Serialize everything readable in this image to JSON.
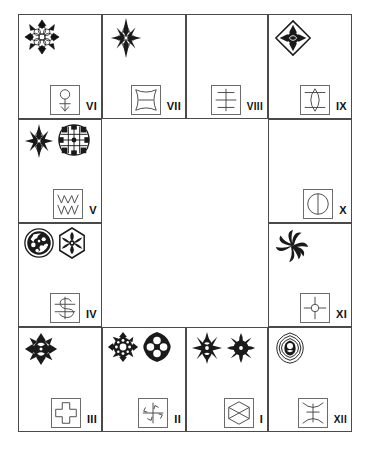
{
  "figure": {
    "type": "ring-diagram",
    "title": "",
    "cell_count": 12,
    "numeral_order_clockwise_from_top_left": [
      "VI",
      "VII",
      "VIII",
      "IX",
      "X",
      "XI",
      "XII",
      "I",
      "II",
      "III",
      "IV",
      "V"
    ],
    "center": "empty",
    "ink_color": "#1a1a1a",
    "frame_color": "#4a4a4a",
    "glyph_box_color": "#6b6b6b"
  },
  "cells": [
    {
      "id": "cell-vi",
      "numeral": "VI",
      "position": "top-row-1",
      "motif_names": [
        "eight-point-star-rosette-outline"
      ],
      "motif_count": 1,
      "glyph_name": "circle-on-stem-with-anchor-arrow"
    },
    {
      "id": "cell-vii",
      "numeral": "VII",
      "position": "top-row-2",
      "motif_names": [
        "four-point-spiky-star-dark"
      ],
      "motif_count": 1,
      "glyph_name": "concave-square-with-horizontal-bar"
    },
    {
      "id": "cell-viii",
      "numeral": "VIII",
      "position": "top-row-3",
      "motif_names": [],
      "motif_count": 0,
      "glyph_name": "cross-divided-square"
    },
    {
      "id": "cell-ix",
      "numeral": "IX",
      "position": "top-row-4",
      "motif_names": [
        "diamond-framed-rosette-dark"
      ],
      "motif_count": 1,
      "glyph_name": "square-with-vertical-lens"
    },
    {
      "id": "cell-x",
      "numeral": "X",
      "position": "right-col-1",
      "motif_names": [],
      "motif_count": 0,
      "glyph_name": "circle-with-vertical-diameter"
    },
    {
      "id": "cell-xi",
      "numeral": "XI",
      "position": "right-col-2",
      "motif_names": [
        "swirl-pinwheel-dark"
      ],
      "motif_count": 1,
      "glyph_name": "quartered-square-with-center-circle"
    },
    {
      "id": "cell-xii",
      "numeral": "XII",
      "position": "bottom-row-4",
      "motif_names": [
        "concentric-lobed-medallion"
      ],
      "motif_count": 1,
      "glyph_name": "square-with-hourglass-and-crossbar"
    },
    {
      "id": "cell-i",
      "numeral": "I",
      "position": "bottom-row-3",
      "motif_names": [
        "spiky-floral-burst-dark",
        "round-petal-rosette-dark"
      ],
      "motif_count": 2,
      "glyph_name": "square-with-crossed-diamond"
    },
    {
      "id": "cell-ii",
      "numeral": "II",
      "position": "bottom-row-2",
      "motif_names": [
        "cogwheel-rosette-dark",
        "quatrefoil-medallion-dark"
      ],
      "motif_count": 2,
      "glyph_name": "square-with-four-arrows-cross"
    },
    {
      "id": "cell-iii",
      "numeral": "III",
      "position": "bottom-row-1",
      "motif_names": [
        "star-burst-floral-dark"
      ],
      "motif_count": 1,
      "glyph_name": "greek-cross-outline"
    },
    {
      "id": "cell-iv",
      "numeral": "IV",
      "position": "left-col-2",
      "motif_names": [
        "circular-yin-mottled-disc",
        "hexagonal-floral-medallion"
      ],
      "motif_count": 2,
      "glyph_name": "square-with-s-curve-and-bar"
    },
    {
      "id": "cell-v",
      "numeral": "V",
      "position": "left-col-1",
      "motif_names": [
        "eight-point-star-dark",
        "grid-filled-round-medallion"
      ],
      "motif_count": 2,
      "glyph_name": "square-with-double-zigzag"
    }
  ]
}
